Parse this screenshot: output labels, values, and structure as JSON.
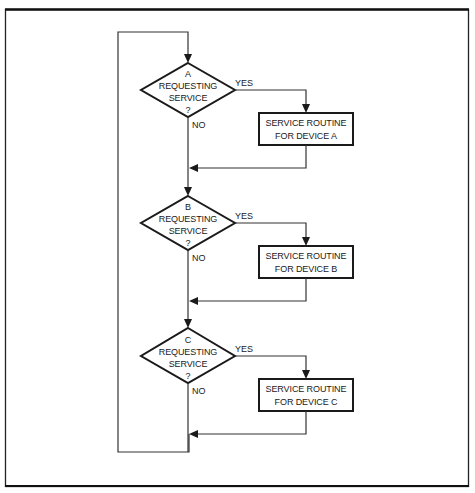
{
  "diagram": {
    "type": "flowchart",
    "decisions": [
      {
        "id": "A",
        "letter": "A",
        "line1": "REQUESTING",
        "line2": "SERVICE",
        "q": "?",
        "yes": "YES",
        "no": "NO"
      },
      {
        "id": "B",
        "letter": "B",
        "line1": "REQUESTING",
        "line2": "SERVICE",
        "q": "?",
        "yes": "YES",
        "no": "NO"
      },
      {
        "id": "C",
        "letter": "C",
        "line1": "REQUESTING",
        "line2": "SERVICE",
        "q": "?",
        "yes": "YES",
        "no": "NO"
      }
    ],
    "processes": [
      {
        "id": "A",
        "line1": "SERVICE ROUTINE",
        "line2": "FOR DEVICE A"
      },
      {
        "id": "B",
        "line1": "SERVICE ROUTINE",
        "line2": "FOR DEVICE B"
      },
      {
        "id": "C",
        "line1": "SERVICE ROUTINE",
        "line2": "FOR DEVICE C"
      }
    ],
    "edges": [
      {
        "from": "loop-start",
        "to": "decision-A"
      },
      {
        "from": "decision-A",
        "to": "process-A",
        "label": "YES"
      },
      {
        "from": "decision-A",
        "to": "merge-A",
        "label": "NO"
      },
      {
        "from": "process-A",
        "to": "merge-A"
      },
      {
        "from": "merge-A",
        "to": "decision-B"
      },
      {
        "from": "decision-B",
        "to": "process-B",
        "label": "YES"
      },
      {
        "from": "decision-B",
        "to": "merge-B",
        "label": "NO"
      },
      {
        "from": "process-B",
        "to": "merge-B"
      },
      {
        "from": "merge-B",
        "to": "decision-C"
      },
      {
        "from": "decision-C",
        "to": "process-C",
        "label": "YES"
      },
      {
        "from": "decision-C",
        "to": "merge-C",
        "label": "NO"
      },
      {
        "from": "process-C",
        "to": "merge-C"
      },
      {
        "from": "merge-C",
        "to": "loop-start"
      }
    ]
  }
}
